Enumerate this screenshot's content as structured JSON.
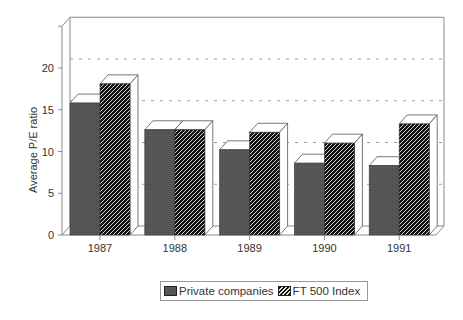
{
  "chart_data": {
    "type": "bar",
    "title": "",
    "xlabel": "",
    "ylabel": "Average P/E ratio",
    "categories": [
      "1987",
      "1988",
      "1989",
      "1990",
      "1991"
    ],
    "series": [
      {
        "name": "Private companies",
        "values": [
          15.8,
          12.6,
          10.2,
          8.6,
          8.3
        ],
        "color": "#555555",
        "pattern": "solid-dark-gray"
      },
      {
        "name": "FT 500 Index",
        "values": [
          18.1,
          12.6,
          12.3,
          11.0,
          13.3
        ],
        "color": "#111111",
        "pattern": "diagonal-hatch"
      }
    ],
    "yticks": [
      "0",
      "5",
      "10",
      "15",
      "20"
    ],
    "ylim": [
      0,
      25
    ],
    "grid": true,
    "style": "3d",
    "legend_position": "bottom"
  },
  "legend": {
    "items": [
      {
        "label": "Private companies"
      },
      {
        "label": "FT 500 Index"
      }
    ]
  }
}
